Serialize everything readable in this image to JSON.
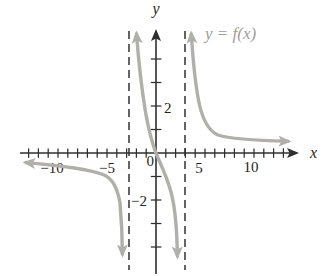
{
  "labels": {
    "y_axis": "y",
    "x_axis": "x",
    "curve": "y = f(x)",
    "origin": "0",
    "x_minus10": "−10",
    "x_minus5": "−5",
    "x_5": "5",
    "x_10": "10",
    "y_2": "2",
    "y_minus2": "−2"
  },
  "colors": {
    "curve": "#b0afab",
    "curve_label": "#9e9d99",
    "axis": "#2f2f2f",
    "text": "#1f1f1f",
    "asymptote": "#3e3e3e",
    "background": "#ffffff"
  },
  "chart_data": {
    "type": "line",
    "title": "",
    "curve_label": "y = f(x)",
    "xlabel": "x",
    "ylabel": "y",
    "grid": false,
    "legend": "none",
    "x_axis": {
      "tick_step": 1,
      "tick_min": -13,
      "tick_max": 13,
      "labeled_ticks": [
        -10,
        -5,
        0,
        5,
        10
      ],
      "range": [
        -14,
        15
      ]
    },
    "y_axis": {
      "tick_step": 1,
      "tick_min": -4,
      "tick_max": 4,
      "labeled_ticks": [
        -2,
        2
      ],
      "range": [
        -5.3,
        5.5
      ]
    },
    "vertical_asymptotes_dashed": [
      -2.8,
      3.0
    ],
    "horizontal_asymptote": 0,
    "series": [
      {
        "name": "left branch",
        "points": [
          [
            -13.5,
            -0.4
          ],
          [
            -9.8,
            -0.55
          ],
          [
            -6.7,
            -0.7
          ],
          [
            -5.2,
            -1.0
          ],
          [
            -4.4,
            -1.3
          ],
          [
            -3.9,
            -1.7
          ],
          [
            -3.6,
            -2.6
          ],
          [
            -3.4,
            -4.6
          ]
        ]
      },
      {
        "name": "middle branch",
        "points": [
          [
            -2.0,
            5.1
          ],
          [
            -1.6,
            3.5
          ],
          [
            -1.2,
            2.3
          ],
          [
            -0.6,
            0.8
          ],
          [
            0,
            0
          ],
          [
            0.8,
            -0.8
          ],
          [
            1.4,
            -1.6
          ],
          [
            1.9,
            -2.6
          ],
          [
            2.2,
            -4.7
          ]
        ]
      },
      {
        "name": "right branch",
        "points": [
          [
            3.6,
            5.1
          ],
          [
            4.0,
            3.5
          ],
          [
            4.4,
            2.3
          ],
          [
            5.0,
            1.4
          ],
          [
            5.7,
            0.9
          ],
          [
            7.0,
            0.7
          ],
          [
            9.6,
            0.55
          ],
          [
            12.1,
            0.5
          ],
          [
            13.9,
            0.5
          ]
        ]
      }
    ]
  }
}
